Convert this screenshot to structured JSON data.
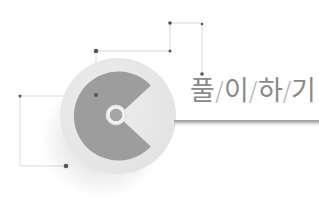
{
  "title": {
    "chars": [
      "풀",
      "이",
      "하",
      "기"
    ],
    "separator": "/"
  },
  "colors": {
    "outer_disc": "#e8e8e8",
    "inner_c": "#9e9e9e",
    "hub_ring": "#f0f0f0",
    "hub_center": "#a8a8a8",
    "dot": "#555555",
    "line": "#cfcfcf",
    "text": "#8a8a8a",
    "underline": "#a9a9a9"
  }
}
